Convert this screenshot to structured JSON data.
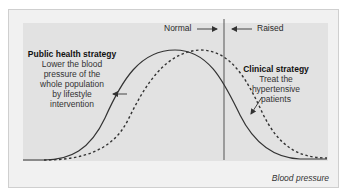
{
  "diagram": {
    "type": "population-distribution-shift",
    "x_axis_label": "Blood pressure",
    "regions": {
      "left_label": "Normal",
      "right_label": "Raised",
      "divider": "vertical line separating normal and raised blood pressure"
    },
    "curves": [
      {
        "name": "current-population-distribution",
        "style": "dashed"
      },
      {
        "name": "shifted-population-distribution",
        "style": "solid"
      }
    ],
    "annotations": {
      "public_health": {
        "title": "Public health strategy",
        "lines": [
          "Lower the blood",
          "pressure of the",
          "whole population",
          "by lifestyle",
          "intervention"
        ]
      },
      "clinical": {
        "title": "Clinical strategy",
        "lines": [
          "Treat the",
          "hypertensive",
          "patients"
        ]
      }
    },
    "colors": {
      "frame_bg": "#f1f1f1",
      "panel_bg": "#e2e2e2",
      "line": "#333333",
      "text": "#222222"
    }
  }
}
